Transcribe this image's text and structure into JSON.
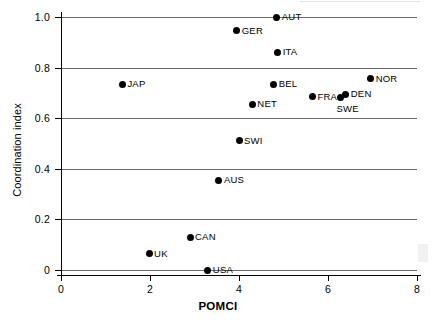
{
  "chart_data": {
    "type": "scatter",
    "title": "",
    "xlabel": "POMCI",
    "ylabel": "Coordination index",
    "xlim": [
      0,
      8
    ],
    "ylim": [
      0,
      1.0
    ],
    "xticks": [
      0,
      2,
      4,
      6,
      8
    ],
    "xtick_labels": [
      "0",
      "2",
      "4",
      "6",
      "8"
    ],
    "yticks": [
      0,
      0.2,
      0.4,
      0.6,
      0.8,
      1.0
    ],
    "ytick_labels": [
      "0",
      "0.2",
      "0.4",
      "0.6",
      "0.8",
      "1.0"
    ],
    "grid": "horizontal",
    "legend": "none",
    "marker": "filled-circle",
    "marker_color": "#000000",
    "gridline_color": "#6a6a6a",
    "points": [
      {
        "label": "AUT",
        "x": 4.85,
        "y": 1.0,
        "label_pos": "right"
      },
      {
        "label": "GER",
        "x": 3.95,
        "y": 0.945,
        "label_pos": "right"
      },
      {
        "label": "ITA",
        "x": 4.87,
        "y": 0.86,
        "label_pos": "right"
      },
      {
        "label": "NOR",
        "x": 6.96,
        "y": 0.755,
        "label_pos": "right"
      },
      {
        "label": "BEL",
        "x": 4.78,
        "y": 0.735,
        "label_pos": "right"
      },
      {
        "label": "JAP",
        "x": 1.38,
        "y": 0.735,
        "label_pos": "right"
      },
      {
        "label": "DEN",
        "x": 6.4,
        "y": 0.695,
        "label_pos": "right"
      },
      {
        "label": "FRA",
        "x": 5.65,
        "y": 0.685,
        "label_pos": "right"
      },
      {
        "label": "SWE",
        "x": 6.28,
        "y": 0.68,
        "label_pos": "below"
      },
      {
        "label": "NET",
        "x": 4.3,
        "y": 0.655,
        "label_pos": "right"
      },
      {
        "label": "SWI",
        "x": 4.0,
        "y": 0.51,
        "label_pos": "right"
      },
      {
        "label": "AUS",
        "x": 3.55,
        "y": 0.355,
        "label_pos": "right"
      },
      {
        "label": "CAN",
        "x": 2.9,
        "y": 0.13,
        "label_pos": "right"
      },
      {
        "label": "UK",
        "x": 1.98,
        "y": 0.065,
        "label_pos": "right"
      },
      {
        "label": "USA",
        "x": 3.3,
        "y": 0.0,
        "label_pos": "right"
      }
    ]
  }
}
